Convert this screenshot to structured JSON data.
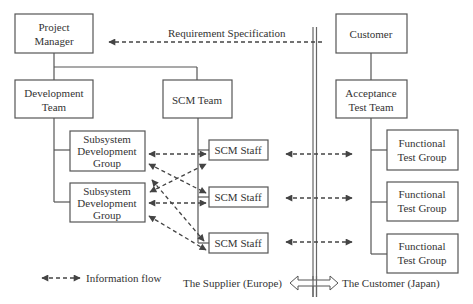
{
  "diagram": {
    "type": "organizational-information-flow",
    "colors": {
      "stroke": "#555555",
      "arrow": "#444444",
      "text": "#333333",
      "background": "#ffffff"
    },
    "nodes": {
      "project_manager": {
        "lines": [
          "Project",
          "Manager"
        ]
      },
      "customer": {
        "lines": [
          "Customer"
        ]
      },
      "development_team": {
        "lines": [
          "Development",
          "Team"
        ]
      },
      "scm_team": {
        "lines": [
          "SCM Team"
        ]
      },
      "acceptance_test_team": {
        "lines": [
          "Acceptance",
          "Test Team"
        ]
      },
      "subsystem_groups": [
        {
          "lines": [
            "Subsystem",
            "Development",
            "Group"
          ]
        },
        {
          "lines": [
            "Subsystem",
            "Development",
            "Group"
          ]
        }
      ],
      "scm_staff": [
        {
          "label": "SCM Staff"
        },
        {
          "label": "SCM Staff"
        },
        {
          "label": "SCM Staff"
        }
      ],
      "functional_test_groups": [
        {
          "lines": [
            "Functional",
            "Test Group"
          ]
        },
        {
          "lines": [
            "Functional",
            "Test Group"
          ]
        },
        {
          "lines": [
            "Functional",
            "Test Group"
          ]
        }
      ]
    },
    "edges": {
      "requirement_label": "Requirement Specification"
    },
    "legend": {
      "information_flow": "Information flow"
    },
    "boundary": {
      "left_label": "The Supplier (Europe)",
      "right_label": "The Customer (Japan)"
    }
  }
}
